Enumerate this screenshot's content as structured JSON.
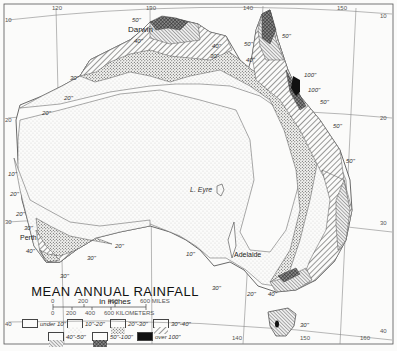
{
  "title": "MEAN ANNUAL RAINFALL",
  "subtitle": "in inches",
  "scale": {
    "miles_ticks": [
      "0",
      "200",
      "400",
      "600 MILES"
    ],
    "km_ticks": [
      "0",
      "200",
      "400",
      "600 KILOMETERS"
    ]
  },
  "legend": [
    {
      "label": "under 10\"",
      "pattern": "blank"
    },
    {
      "label": "10\"-20\"",
      "pattern": "fine-dots"
    },
    {
      "label": "20\"-30\"",
      "pattern": "dense-dots"
    },
    {
      "label": "30\"-40\"",
      "pattern": "diag-hatch"
    },
    {
      "label": "40\"-50\"",
      "pattern": "fine-diag-hatch"
    },
    {
      "label": "50\"-100\"",
      "pattern": "cross-hatch"
    },
    {
      "label": "over 100\"",
      "pattern": "solid-black"
    }
  ],
  "places": {
    "darwin": "Darwin",
    "perth": "Perth",
    "adelaide": "Adelaide",
    "lake_eyre": "L. Eyre"
  },
  "graticule": {
    "longitudes": [
      "120",
      "130",
      "140",
      "150",
      "160"
    ],
    "latitudes": [
      "10",
      "20",
      "30",
      "40"
    ],
    "bottom_longitudes": [
      "140",
      "150",
      "160"
    ]
  },
  "isohyet_labels": {
    "nw_50": "50\"",
    "nw_40": "40\"",
    "kimberley_30": "30\"",
    "kimberley_20": "20\"",
    "wa_20a": "20\"",
    "wa_10": "10\"",
    "wa_20b": "20\"",
    "wa_20c": "20\"",
    "wa_30": "30\"",
    "perth_40": "40\"",
    "sw_20": "20\"",
    "sw_30": "30\"",
    "sw_30b": "30\"",
    "sa_10": "10\"",
    "qld_50a": "50\"",
    "qld_50b": "50\"",
    "qld_40": "40\"",
    "qld_100a": "100\"",
    "qld_100b": "100\"",
    "qld_50c": "50\"",
    "qld_50d": "50\"",
    "nsw_50": "50\"",
    "vic_30": "30\"",
    "vic_20": "20\"",
    "vic_40": "40\"",
    "tas_30": "30\"",
    "gulf_40": "40\"",
    "gulf_30": "30\""
  }
}
